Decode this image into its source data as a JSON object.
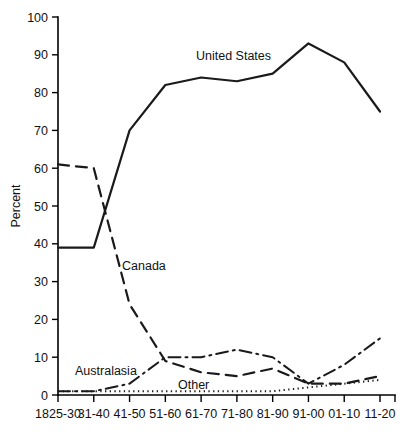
{
  "chart_data": {
    "type": "line",
    "title": "",
    "xlabel": "",
    "ylabel": "Percent",
    "ylim": [
      0,
      100
    ],
    "ytick_values": [
      0,
      10,
      20,
      30,
      40,
      50,
      60,
      70,
      80,
      90,
      100
    ],
    "ytick_labels": [
      "0",
      "10",
      "20",
      "30",
      "40",
      "50",
      "60",
      "70",
      "80",
      "90",
      "100"
    ],
    "grid": false,
    "legend_position": "inline-annotations",
    "categories": [
      "1825-30",
      "31-40",
      "41-50",
      "51-60",
      "61-70",
      "71-80",
      "81-90",
      "91-00",
      "01-10",
      "11-20"
    ],
    "series": [
      {
        "name": "United States",
        "style": "solid",
        "values": [
          39,
          39,
          70,
          82,
          84,
          83,
          85,
          93,
          88,
          75
        ]
      },
      {
        "name": "Canada",
        "style": "dashed",
        "values": [
          61,
          60,
          24,
          9,
          6,
          5,
          7,
          3,
          3,
          5
        ]
      },
      {
        "name": "Australasia",
        "style": "dash-dot",
        "values": [
          1,
          1,
          3,
          10,
          10,
          12,
          10,
          3,
          8,
          15
        ]
      },
      {
        "name": "Other",
        "style": "dotted",
        "values": [
          1,
          1,
          1,
          1,
          1,
          1,
          1,
          2,
          3,
          4
        ]
      }
    ],
    "annotations": [
      {
        "text": "United States",
        "series": "United States",
        "x_px": 196,
        "y_px": 60
      },
      {
        "text": "Canada",
        "series": "Canada",
        "x_px": 122,
        "y_px": 270
      },
      {
        "text": "Australasia",
        "series": "Australasia",
        "x_px": 75,
        "y_px": 375
      },
      {
        "text": "Other",
        "series": "Other",
        "x_px": 178,
        "y_px": 389
      }
    ]
  },
  "axes": {
    "y_title": "Percent"
  }
}
